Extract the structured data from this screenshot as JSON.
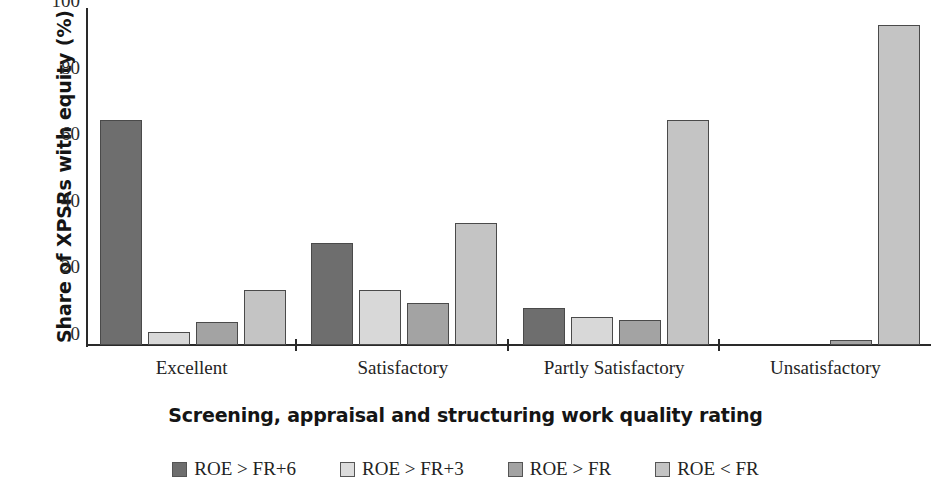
{
  "chart_data": {
    "type": "bar",
    "title": "",
    "xlabel": "Screening, appraisal and structuring work quality rating",
    "ylabel": "Share of XPSRs with equity (%)",
    "categories": [
      "Excellent",
      "Satisfactory",
      "Partly Satisfactory",
      "Unsatisfactory"
    ],
    "series": [
      {
        "name": "ROE > FR+6",
        "color": "#6e6e6e",
        "values": [
          67.5,
          30.5,
          11,
          0
        ]
      },
      {
        "name": "ROE > FR+3",
        "color": "#d8d8d8",
        "values": [
          4,
          16.5,
          8.5,
          0
        ]
      },
      {
        "name": "ROE > FR",
        "color": "#a3a3a3",
        "values": [
          7,
          12.5,
          7.5,
          1.5
        ]
      },
      {
        "name": "ROE < FR",
        "color": "#c4c4c4",
        "values": [
          16.5,
          36.5,
          67.5,
          96
        ]
      }
    ],
    "ylim": [
      0,
      100
    ],
    "yticks": [
      0,
      20,
      40,
      60,
      80,
      100
    ],
    "grid": false,
    "legend_position": "bottom"
  },
  "axis": {
    "y_title": "Share of XPSRs with equity (%)",
    "x_title": "Screening, appraisal and structuring work quality rating",
    "y_tick_labels": [
      "100",
      "80",
      "60",
      "40",
      "20",
      "0"
    ]
  },
  "legend": {
    "items": [
      {
        "label": "ROE > FR+6"
      },
      {
        "label": "ROE > FR+3"
      },
      {
        "label": "ROE > FR"
      },
      {
        "label": "ROE < FR"
      }
    ]
  }
}
